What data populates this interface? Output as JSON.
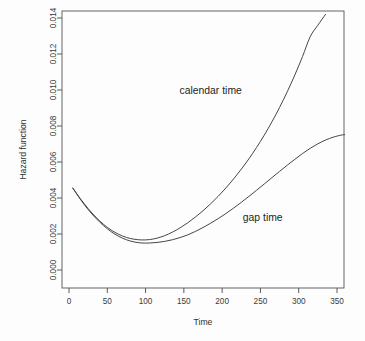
{
  "chart_data": {
    "type": "line",
    "title": "",
    "subtitle": "",
    "xlabel": "Time",
    "ylabel": "Hazard function",
    "xlim": [
      0,
      365
    ],
    "ylim": [
      0.0,
      0.0142
    ],
    "grid": false,
    "legend_position": "inline-annotations",
    "xticks": [
      0,
      50,
      100,
      150,
      200,
      250,
      300,
      350
    ],
    "xtick_labels": [
      "0",
      "50",
      "100",
      "150",
      "200",
      "250",
      "300",
      "350"
    ],
    "yticks": [
      0.0,
      0.002,
      0.004,
      0.006,
      0.008,
      0.01,
      0.012,
      0.014
    ],
    "ytick_labels": [
      "0.000",
      "0.002",
      "0.004",
      "0.006",
      "0.008",
      "0.010",
      "0.012",
      "0.014"
    ],
    "annotations": [
      {
        "text": "calendar time",
        "x": 185,
        "y": 0.0098
      },
      {
        "text": "gap time",
        "x": 253,
        "y": 0.0027
      }
    ],
    "series": [
      {
        "name": "calendar time",
        "x": [
          5,
          15,
          25,
          35,
          45,
          55,
          65,
          75,
          85,
          95,
          105,
          115,
          125,
          135,
          145,
          155,
          165,
          175,
          185,
          195,
          205,
          215,
          225,
          235,
          245,
          255,
          265,
          275,
          285,
          295,
          305,
          315,
          325,
          335
        ],
        "values": [
          0.00455,
          0.00395,
          0.00341,
          0.00294,
          0.00254,
          0.00222,
          0.00198,
          0.00181,
          0.00171,
          0.00167,
          0.00169,
          0.00177,
          0.00191,
          0.0021,
          0.00234,
          0.00262,
          0.00294,
          0.00329,
          0.00368,
          0.0041,
          0.00456,
          0.00506,
          0.0056,
          0.00618,
          0.00681,
          0.00749,
          0.00823,
          0.00903,
          0.0099,
          0.01084,
          0.01186,
          0.01296,
          0.0136,
          0.0142
        ]
      },
      {
        "name": "gap time",
        "x": [
          5,
          15,
          25,
          35,
          45,
          55,
          65,
          75,
          85,
          95,
          105,
          115,
          125,
          135,
          145,
          155,
          165,
          175,
          185,
          195,
          205,
          215,
          225,
          235,
          245,
          255,
          265,
          275,
          285,
          295,
          305,
          315,
          325,
          335,
          345,
          355,
          360
        ],
        "values": [
          0.00455,
          0.00392,
          0.00336,
          0.00288,
          0.00247,
          0.00213,
          0.00187,
          0.00168,
          0.00156,
          0.0015,
          0.0015,
          0.00153,
          0.00159,
          0.00168,
          0.0018,
          0.00195,
          0.00214,
          0.00236,
          0.0026,
          0.00286,
          0.00314,
          0.00344,
          0.00376,
          0.00409,
          0.00443,
          0.00478,
          0.00513,
          0.00548,
          0.00582,
          0.00615,
          0.00647,
          0.00676,
          0.00701,
          0.00722,
          0.00738,
          0.00749,
          0.00752
        ]
      }
    ]
  }
}
